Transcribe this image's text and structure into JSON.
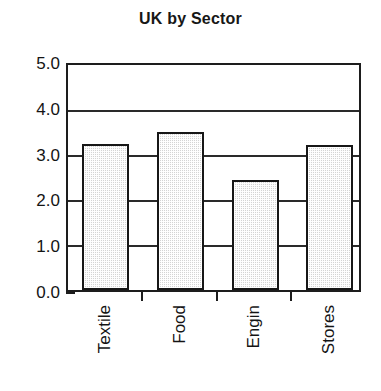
{
  "chart_data": {
    "type": "bar",
    "title": "UK by Sector",
    "xlabel": "",
    "ylabel": "",
    "categories": [
      "Textile",
      "Food",
      "Engin",
      "Stores"
    ],
    "values": [
      3.25,
      3.52,
      2.45,
      3.22
    ],
    "ylim": [
      0.0,
      5.0
    ],
    "ytick_labels": [
      "5.0",
      "4.0",
      "3.0",
      "2.0",
      "1.0",
      "0.0"
    ],
    "ytick_values": [
      5.0,
      4.0,
      3.0,
      2.0,
      1.0,
      0.0
    ],
    "grid": true,
    "legend": false,
    "bar_fill": "#d4d4d4",
    "bar_edge": "#171717",
    "axis_color": "#1d1d1d",
    "background": "#ffffff",
    "xtick_label_rotation": 90
  }
}
